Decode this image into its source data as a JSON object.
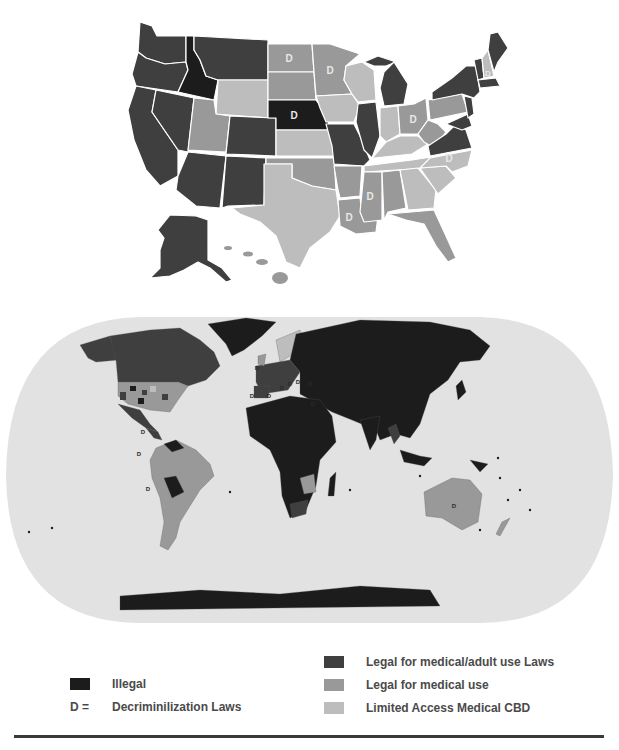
{
  "colors": {
    "illegal": "#1c1c1c",
    "medical_adult": "#3f3f3f",
    "medical": "#999999",
    "cbd": "#bdbdbd",
    "ocean": "#e2e2e2",
    "background": "#ffffff"
  },
  "us_map": {
    "title": "United States cannabis law status",
    "decrim_marker": "D",
    "states": [
      {
        "name": "Washington",
        "status": "medical_adult"
      },
      {
        "name": "Oregon",
        "status": "medical_adult"
      },
      {
        "name": "California",
        "status": "medical_adult"
      },
      {
        "name": "Nevada",
        "status": "medical_adult"
      },
      {
        "name": "Idaho",
        "status": "illegal"
      },
      {
        "name": "Montana",
        "status": "medical_adult"
      },
      {
        "name": "Wyoming",
        "status": "cbd"
      },
      {
        "name": "Utah",
        "status": "medical"
      },
      {
        "name": "Arizona",
        "status": "medical_adult"
      },
      {
        "name": "Colorado",
        "status": "medical_adult"
      },
      {
        "name": "New Mexico",
        "status": "medical_adult"
      },
      {
        "name": "North Dakota",
        "status": "medical",
        "decrim": true
      },
      {
        "name": "South Dakota",
        "status": "medical"
      },
      {
        "name": "Nebraska",
        "status": "illegal",
        "decrim": true
      },
      {
        "name": "Kansas",
        "status": "cbd"
      },
      {
        "name": "Oklahoma",
        "status": "medical"
      },
      {
        "name": "Texas",
        "status": "cbd"
      },
      {
        "name": "Minnesota",
        "status": "medical",
        "decrim": true
      },
      {
        "name": "Iowa",
        "status": "cbd"
      },
      {
        "name": "Missouri",
        "status": "medical_adult"
      },
      {
        "name": "Arkansas",
        "status": "medical"
      },
      {
        "name": "Louisiana",
        "status": "medical",
        "decrim": true
      },
      {
        "name": "Wisconsin",
        "status": "cbd"
      },
      {
        "name": "Illinois",
        "status": "medical_adult"
      },
      {
        "name": "Michigan",
        "status": "medical_adult"
      },
      {
        "name": "Indiana",
        "status": "cbd"
      },
      {
        "name": "Ohio",
        "status": "medical",
        "decrim": true
      },
      {
        "name": "Kentucky",
        "status": "cbd"
      },
      {
        "name": "Tennessee",
        "status": "cbd"
      },
      {
        "name": "Mississippi",
        "status": "medical",
        "decrim": true
      },
      {
        "name": "Alabama",
        "status": "medical"
      },
      {
        "name": "Georgia",
        "status": "cbd"
      },
      {
        "name": "Florida",
        "status": "medical"
      },
      {
        "name": "South Carolina",
        "status": "cbd"
      },
      {
        "name": "North Carolina",
        "status": "cbd",
        "decrim": true
      },
      {
        "name": "Virginia",
        "status": "medical_adult"
      },
      {
        "name": "West Virginia",
        "status": "medical"
      },
      {
        "name": "Pennsylvania",
        "status": "medical"
      },
      {
        "name": "New York",
        "status": "medical_adult"
      },
      {
        "name": "Vermont",
        "status": "medical_adult"
      },
      {
        "name": "New Hampshire",
        "status": "cbd",
        "decrim": true
      },
      {
        "name": "Maine",
        "status": "medical_adult"
      },
      {
        "name": "Massachusetts",
        "status": "medical_adult"
      },
      {
        "name": "New Jersey",
        "status": "medical_adult"
      },
      {
        "name": "Maryland",
        "status": "medical_adult"
      },
      {
        "name": "Alaska",
        "status": "medical_adult"
      },
      {
        "name": "Hawaii",
        "status": "medical"
      }
    ]
  },
  "world_map": {
    "title": "World cannabis law status",
    "decrim_marker": "D"
  },
  "legend": {
    "illegal_label": "Illegal",
    "decrim_key": "D  =",
    "decrim_label": "Decriminilization Laws",
    "medical_adult_label": "Legal for medical/adult use Laws",
    "medical_label": "Legal for medical use",
    "cbd_label": "Limited Access Medical CBD"
  }
}
